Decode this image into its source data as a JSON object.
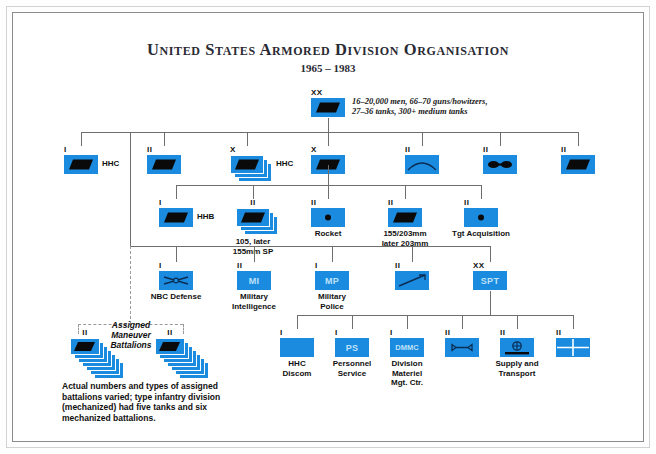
{
  "header": {
    "title": "United States Armored Division Organisation",
    "subtitle": "1965 – 1983"
  },
  "division": {
    "echelon": "XX",
    "symbol": "armor",
    "note_line1": "16–20,000 men, 66–70 guns/howitzers,",
    "note_line2": "27–36 tanks, 300+ medium tanks"
  },
  "colors": {
    "unit_blue": "#1b8be0",
    "inner_label": "#bfe2fa",
    "line": "#6e6e6e",
    "frame_outer": "#d2d2d2",
    "frame_inner": "#8c8c8c"
  },
  "row_divisional": [
    {
      "echelon": "I",
      "symbol": "armor",
      "side_label": "HHC",
      "stacked": false
    },
    {
      "echelon": "II",
      "symbol": "armor",
      "side_label": "",
      "stacked": false
    },
    {
      "echelon": "X",
      "symbol": "armor",
      "side_label": "HHC",
      "stacked": true
    },
    {
      "echelon": "X",
      "symbol": "armor",
      "side_label": "",
      "stacked": false
    },
    {
      "echelon": "II",
      "symbol": "engineer",
      "side_label": "",
      "stacked": false
    },
    {
      "echelon": "II",
      "symbol": "aviation",
      "side_label": "",
      "stacked": false
    },
    {
      "echelon": "II",
      "symbol": "armor",
      "side_label": "",
      "stacked": false
    }
  ],
  "row_artillery": [
    {
      "echelon": "I",
      "symbol": "armor",
      "side_label": "HHB",
      "under_label": "",
      "stacked": false
    },
    {
      "echelon": "II",
      "symbol": "armor",
      "side_label": "",
      "under_label": "105, later\n155mm SP",
      "stacked": true
    },
    {
      "echelon": "II",
      "symbol": "dot",
      "side_label": "",
      "under_label": "Rocket",
      "stacked": false
    },
    {
      "echelon": "II",
      "symbol": "armor",
      "side_label": "",
      "under_label": "155/203mm\nlater 203mm",
      "stacked": false
    },
    {
      "echelon": "II",
      "symbol": "dot",
      "side_label": "",
      "under_label": "Tgt Acquisition",
      "stacked": false
    }
  ],
  "row_support_branches": [
    {
      "echelon": "I",
      "symbol": "nbc",
      "inner_label": "",
      "under_label": "NBC Defense"
    },
    {
      "echelon": "II",
      "symbol": "text",
      "inner_label": "MI",
      "under_label": "Military\nIntelligence"
    },
    {
      "echelon": "I",
      "symbol": "text",
      "inner_label": "MP",
      "under_label": "Military\nPolice"
    },
    {
      "echelon": "II",
      "symbol": "signal",
      "inner_label": "",
      "under_label": ""
    },
    {
      "echelon": "XX",
      "symbol": "text",
      "inner_label": "SPT",
      "under_label": ""
    }
  ],
  "row_discom": [
    {
      "echelon": "I",
      "symbol": "blank",
      "inner_label": "",
      "under_label": "HHC\nDiscom"
    },
    {
      "echelon": "I",
      "symbol": "text",
      "inner_label": "PS",
      "under_label": "Personnel\nService"
    },
    {
      "echelon": "I",
      "symbol": "text",
      "inner_label": "DMMC",
      "under_label": "Division\nMateriel\nMgt. Ctr."
    },
    {
      "echelon": "II",
      "symbol": "wrench",
      "inner_label": "",
      "under_label": ""
    },
    {
      "echelon": "II",
      "symbol": "supply",
      "inner_label": "",
      "under_label": "Supply and\nTransport"
    },
    {
      "echelon": "II",
      "symbol": "medical",
      "inner_label": "",
      "under_label": ""
    }
  ],
  "maneuver": {
    "label_line1": "Assigned",
    "label_line2": "Maneuver",
    "label_line3": "Battalions",
    "left_echelon": "II",
    "right_echelon": "II",
    "caption": "Actual numbers and types of assigned battalions varied; type infantry division (mechanized) had five tanks and six mechanized battalions."
  }
}
